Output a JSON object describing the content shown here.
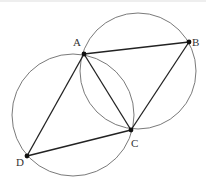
{
  "diagram": {
    "colors": {
      "circle": "#7a7a7a",
      "segment": "#222222",
      "point": "#111111",
      "label": "#333333"
    },
    "points": {
      "A": {
        "label": "A",
        "x": 84,
        "y": 54
      },
      "B": {
        "label": "B",
        "x": 189,
        "y": 42
      },
      "C": {
        "label": "C",
        "x": 131,
        "y": 130
      },
      "D": {
        "label": "D",
        "x": 27,
        "y": 156
      }
    },
    "circles": [
      {
        "name": "left-circle",
        "through": [
          "A",
          "C",
          "D"
        ],
        "cx": 73,
        "cy": 115,
        "r": 61
      },
      {
        "name": "right-circle",
        "through": [
          "A",
          "B",
          "C"
        ],
        "cx": 138,
        "cy": 71,
        "r": 58
      }
    ],
    "segments": [
      {
        "name": "AB",
        "from": "A",
        "to": "B"
      },
      {
        "name": "BC",
        "from": "B",
        "to": "C"
      },
      {
        "name": "CD",
        "from": "C",
        "to": "D"
      },
      {
        "name": "DA",
        "from": "D",
        "to": "A"
      },
      {
        "name": "AC",
        "from": "A",
        "to": "C"
      }
    ]
  }
}
